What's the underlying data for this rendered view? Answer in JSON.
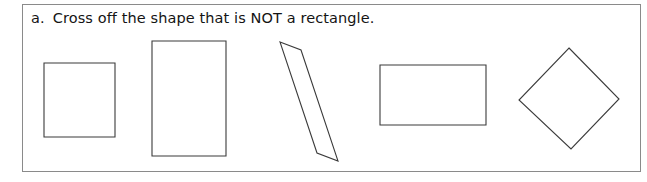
{
  "worksheet": {
    "problem_letter": "a.",
    "instruction": "Cross off the shape that is NOT a rectangle.",
    "border_color": "#8a8a8a",
    "text_color": "#141414",
    "shape_stroke_color": "#3b3b3b",
    "shape_fill_color": "#ffffff",
    "background_color": "#ffffff"
  },
  "shapes": [
    {
      "name": "square",
      "kind": "rectangle",
      "is_rectangle": true,
      "crossed_off": false,
      "rotation_deg": 0,
      "points": "21,58 92,58 92,132 21,132"
    },
    {
      "name": "tall-rectangle",
      "kind": "rectangle",
      "is_rectangle": true,
      "crossed_off": false,
      "rotation_deg": 0,
      "points": "129,36 203,36 203,151 129,151"
    },
    {
      "name": "tilted-rectangle",
      "kind": "rectangle",
      "is_rectangle": true,
      "crossed_off": false,
      "rotation_deg": 20,
      "points": "257,37 278,45 315,156 294,148"
    },
    {
      "name": "wide-rectangle",
      "kind": "rectangle",
      "is_rectangle": true,
      "crossed_off": false,
      "rotation_deg": 0,
      "points": "357,60 463,60 463,120 357,120"
    },
    {
      "name": "diamond",
      "kind": "square-rotated",
      "is_rectangle": false,
      "crossed_off": false,
      "rotation_deg": 45,
      "points": "546,43 596,94 548,144 496,95"
    }
  ]
}
